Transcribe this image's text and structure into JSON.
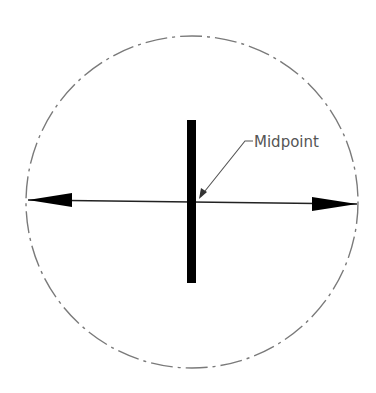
{
  "diagram": {
    "label": {
      "text": "Midpoint",
      "x": 254,
      "y": 147
    },
    "circle": {
      "cx": 192,
      "cy": 202,
      "r": 165,
      "style": "dash-dot center line",
      "color": "#777777"
    },
    "diameter_arrow": {
      "x1": 28,
      "y1": 200,
      "x2": 357,
      "y2": 204,
      "color": "#222222"
    },
    "perpendicular_bar": {
      "x": 187,
      "y_top": 120,
      "y_bottom": 283,
      "width": 9,
      "color": "#000000"
    },
    "leader": {
      "points": [
        [
          199,
          198
        ],
        [
          245,
          141
        ],
        [
          253,
          141
        ]
      ],
      "color": "#555555"
    }
  }
}
